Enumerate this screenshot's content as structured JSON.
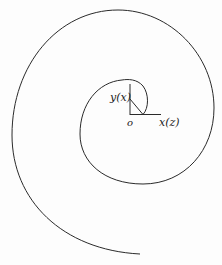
{
  "figure": {
    "type": "spiral-diagram",
    "labels": {
      "y_axis": "y(x)",
      "x_axis": "x(z)",
      "origin": "o"
    },
    "stroke_color": "#2a2a2a",
    "background": "#fdfdfd"
  }
}
